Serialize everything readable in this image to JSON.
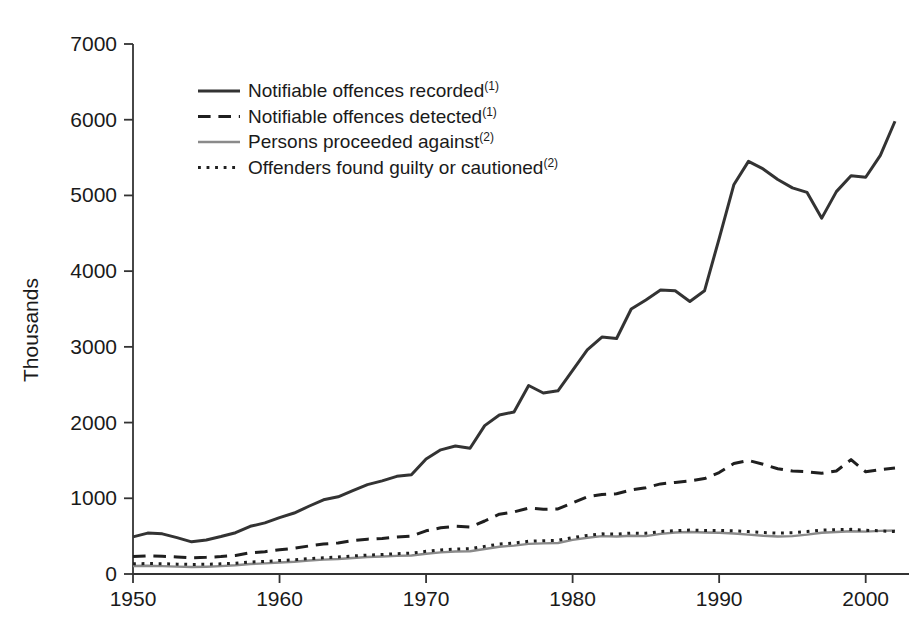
{
  "chart_data": {
    "type": "line",
    "title": "",
    "xlabel": "",
    "ylabel": "Thousands",
    "xlim": [
      1950,
      2002
    ],
    "ylim": [
      0,
      7000
    ],
    "grid": false,
    "legend_position": "top-left-inside",
    "x_ticks": [
      "1950",
      "1960",
      "1970",
      "1980",
      "1990",
      "2000"
    ],
    "x_tick_values": [
      1950,
      1960,
      1970,
      1980,
      1990,
      2000
    ],
    "y_ticks": [
      "0",
      "1000",
      "2000",
      "3000",
      "4000",
      "5000",
      "6000",
      "7000"
    ],
    "y_tick_values": [
      0,
      1000,
      2000,
      3000,
      4000,
      5000,
      6000,
      7000
    ],
    "x": [
      1950,
      1951,
      1952,
      1953,
      1954,
      1955,
      1956,
      1957,
      1958,
      1959,
      1960,
      1961,
      1962,
      1963,
      1964,
      1965,
      1966,
      1967,
      1968,
      1969,
      1970,
      1971,
      1972,
      1973,
      1974,
      1975,
      1976,
      1977,
      1978,
      1979,
      1980,
      1981,
      1982,
      1983,
      1984,
      1985,
      1986,
      1987,
      1988,
      1989,
      1990,
      1991,
      1992,
      1993,
      1994,
      1995,
      1996,
      1997,
      1998,
      1999,
      2000,
      2001,
      2002
    ],
    "series": [
      {
        "name": "Notifiable offences recorded",
        "footnote": "(1)",
        "style": "solid",
        "color": "#333333",
        "width": 3.0,
        "values": [
          490,
          540,
          530,
          480,
          425,
          450,
          495,
          545,
          630,
          675,
          745,
          805,
          895,
          980,
          1020,
          1100,
          1180,
          1230,
          1290,
          1310,
          1520,
          1640,
          1690,
          1660,
          1960,
          2100,
          2140,
          2490,
          2390,
          2420,
          2690,
          2960,
          3130,
          3110,
          3500,
          3620,
          3750,
          3740,
          3600,
          3740,
          4430,
          5140,
          5450,
          5350,
          5210,
          5100,
          5040,
          4700,
          5050,
          5260,
          5240,
          5530,
          5980
        ]
      },
      {
        "name": "Notifiable offences detected",
        "footnote": "(1)",
        "style": "dashed",
        "color": "#1f1f1f",
        "width": 3.0,
        "values": [
          230,
          240,
          235,
          225,
          215,
          220,
          230,
          245,
          280,
          295,
          320,
          340,
          370,
          395,
          410,
          440,
          460,
          470,
          490,
          500,
          570,
          610,
          630,
          620,
          700,
          790,
          820,
          870,
          855,
          860,
          940,
          1020,
          1050,
          1060,
          1110,
          1140,
          1190,
          1210,
          1230,
          1260,
          1340,
          1460,
          1500,
          1450,
          1390,
          1360,
          1350,
          1330,
          1360,
          1510,
          1350,
          1380,
          1400
        ]
      },
      {
        "name": "Persons proceeded against",
        "footnote": "(2)",
        "style": "solid",
        "color": "#8a8a8a",
        "width": 2.4,
        "values": [
          105,
          108,
          104,
          98,
          92,
          96,
          104,
          115,
          132,
          140,
          152,
          162,
          178,
          190,
          198,
          212,
          224,
          232,
          240,
          245,
          268,
          285,
          298,
          300,
          330,
          360,
          375,
          398,
          405,
          410,
          450,
          478,
          500,
          495,
          505,
          500,
          530,
          548,
          555,
          548,
          545,
          535,
          520,
          505,
          495,
          500,
          520,
          545,
          555,
          565,
          560,
          570,
          575
        ]
      },
      {
        "name": "Offenders found guilty or cautioned",
        "footnote": "(2)",
        "style": "dotted",
        "color": "#1f1f1f",
        "width": 3.0,
        "values": [
          135,
          138,
          136,
          130,
          126,
          128,
          134,
          142,
          158,
          166,
          178,
          188,
          202,
          215,
          225,
          238,
          250,
          258,
          268,
          275,
          300,
          318,
          330,
          335,
          365,
          395,
          410,
          432,
          440,
          445,
          480,
          510,
          530,
          528,
          540,
          538,
          560,
          572,
          580,
          575,
          575,
          570,
          560,
          548,
          540,
          545,
          560,
          580,
          585,
          590,
          578,
          570,
          560
        ]
      }
    ]
  },
  "legend": {
    "items": [
      {
        "label": "Notifiable offences recorded",
        "sup": "(1)",
        "swatch": "solid-black-line"
      },
      {
        "label": "Notifiable offences detected",
        "sup": "(1)",
        "swatch": "dashed-black-line"
      },
      {
        "label": "Persons proceeded against",
        "sup": "(2)",
        "swatch": "solid-grey-line"
      },
      {
        "label": "Offenders found guilty or cautioned",
        "sup": "(2)",
        "swatch": "dotted-black-line"
      }
    ]
  }
}
